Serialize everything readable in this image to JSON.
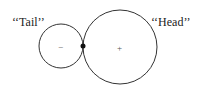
{
  "diagram": {
    "tail_label": "‘‘Tail’’",
    "head_label": "‘‘Head’’",
    "tail_sign": "−",
    "head_sign": "+",
    "tail_circle": {
      "cx": 61,
      "cy": 46,
      "r": 22
    },
    "head_circle": {
      "cx": 120,
      "cy": 47,
      "r": 37
    },
    "junction_point": {
      "cx": 83,
      "cy": 46,
      "r": 2.5
    },
    "stroke_color": "#333333"
  }
}
